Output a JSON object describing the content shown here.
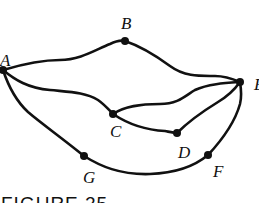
{
  "figure": {
    "caption": "FIGURE 25",
    "stroke_color": "#111111",
    "background": "#ffffff"
  },
  "vertices": [
    {
      "id": "A",
      "label": "A",
      "x": 3,
      "y": 70
    },
    {
      "id": "B",
      "label": "B",
      "x": 125,
      "y": 41
    },
    {
      "id": "E",
      "label": "E",
      "x": 240,
      "y": 82
    },
    {
      "id": "C",
      "label": "C",
      "x": 113,
      "y": 114
    },
    {
      "id": "D",
      "label": "D",
      "x": 177,
      "y": 133
    },
    {
      "id": "F",
      "label": "F",
      "x": 208,
      "y": 155
    },
    {
      "id": "G",
      "label": "G",
      "x": 84,
      "y": 156
    }
  ],
  "edges": [
    {
      "from": "A",
      "to": "B"
    },
    {
      "from": "B",
      "to": "E"
    },
    {
      "from": "A",
      "to": "C"
    },
    {
      "from": "C",
      "to": "E"
    },
    {
      "from": "C",
      "to": "D"
    },
    {
      "from": "D",
      "to": "E"
    },
    {
      "from": "A",
      "to": "G"
    },
    {
      "from": "G",
      "to": "F"
    },
    {
      "from": "F",
      "to": "E"
    }
  ]
}
